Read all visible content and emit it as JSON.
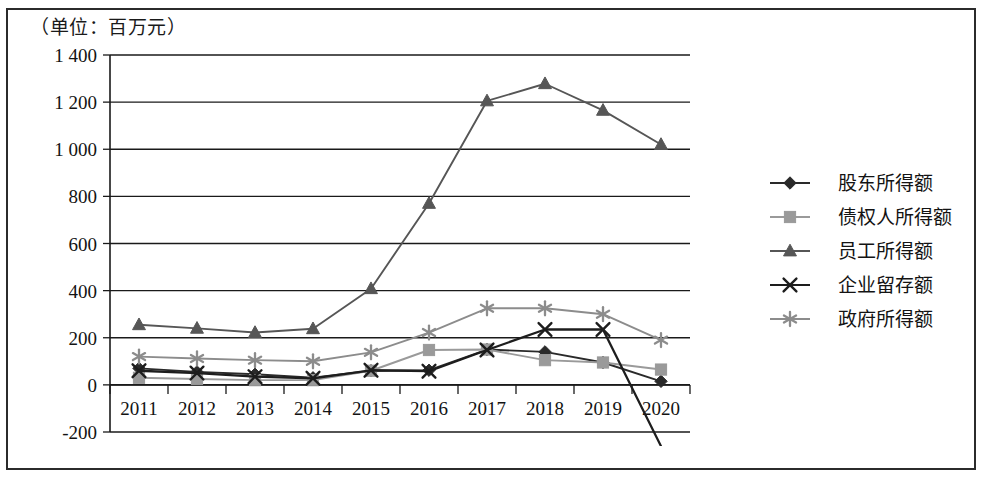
{
  "figure": {
    "unit_label": "（单位：百万元）",
    "frame_color": "#2b2b2b"
  },
  "chart_data": {
    "type": "line",
    "title": "",
    "subtitle": "",
    "unit_note": "（单位：百万元）",
    "xlabel": "",
    "ylabel": "",
    "categories": [
      "2011",
      "2012",
      "2013",
      "2014",
      "2015",
      "2016",
      "2017",
      "2018",
      "2019",
      "2020"
    ],
    "x": [
      2011,
      2012,
      2013,
      2014,
      2015,
      2016,
      2017,
      2018,
      2019,
      2020
    ],
    "ylim": [
      -200,
      1400
    ],
    "ytick_labels": [
      "1 400",
      "1 200",
      "1 000",
      "800",
      "600",
      "400",
      "200",
      "0",
      "-200"
    ],
    "ytick_values": [
      1400,
      1200,
      1000,
      800,
      600,
      400,
      200,
      0,
      -200
    ],
    "grid": "horizontal",
    "legend_position": "right",
    "series": [
      {
        "name": "股东所得额",
        "marker": "diamond",
        "color": "#2a2a2a",
        "values": [
          70,
          55,
          45,
          30,
          60,
          62,
          150,
          140,
          95,
          15
        ]
      },
      {
        "name": "债权人所得额",
        "marker": "square",
        "color": "#9a9a9a",
        "values": [
          30,
          25,
          20,
          20,
          60,
          148,
          150,
          105,
          95,
          65
        ]
      },
      {
        "name": "员工所得额",
        "marker": "triangle",
        "color": "#565656",
        "values": [
          255,
          240,
          222,
          238,
          408,
          770,
          1205,
          1278,
          1165,
          1020
        ]
      },
      {
        "name": "企业留存额",
        "marker": "cross",
        "color": "#1d1d1d",
        "values": [
          60,
          50,
          35,
          28,
          62,
          58,
          148,
          235,
          235,
          -260
        ]
      },
      {
        "name": "政府所得额",
        "marker": "star",
        "color": "#8c8c8c",
        "values": [
          120,
          112,
          105,
          100,
          138,
          222,
          325,
          325,
          300,
          190
        ]
      }
    ]
  },
  "legend": {
    "items": [
      {
        "label": "股东所得额",
        "marker": "diamond",
        "color": "#2a2a2a"
      },
      {
        "label": "债权人所得额",
        "marker": "square",
        "color": "#9a9a9a"
      },
      {
        "label": "员工所得额",
        "marker": "triangle",
        "color": "#565656"
      },
      {
        "label": "企业留存额",
        "marker": "cross",
        "color": "#1d1d1d"
      },
      {
        "label": "政府所得额",
        "marker": "star",
        "color": "#8c8c8c"
      }
    ]
  }
}
